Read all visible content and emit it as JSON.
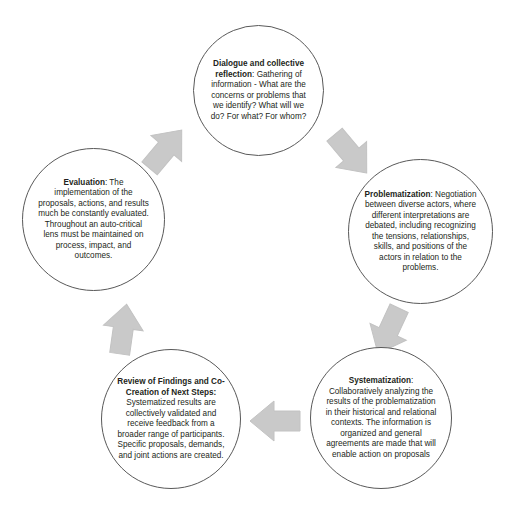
{
  "diagram": {
    "type": "cyclical-process",
    "direction": "clockwise",
    "palette": {
      "circle_stroke": "#595959",
      "arrow_fill": "#c9c9c9",
      "arrow_stroke": "#bfbfbf",
      "text": "#231f20",
      "background": "#ffffff"
    },
    "nodes": [
      {
        "id": "dialogue",
        "position": "top",
        "title": "Dialogue and collective reflection",
        "separator": ": ",
        "body": "Gathering of information - What are the concerns or problems that we identify? What will we do? For what? For whom?"
      },
      {
        "id": "problematization",
        "position": "right",
        "title": "Problematization",
        "separator": ": ",
        "body": "Negotiation between diverse actors, where different interpretations are debated, including recognizing the tensions, relationships, skills, and positions of the actors in relation to the problems."
      },
      {
        "id": "systematization",
        "position": "bottom-right",
        "title": "Systematization",
        "separator": ": ",
        "body": "Collaboratively analyzing the results of the problematization in their historical and relational contexts. The information is organized and general agreements are made that will enable action on proposals"
      },
      {
        "id": "review",
        "position": "bottom-left",
        "title": "Review of Findings and Co-Creation of Next Steps:",
        "separator": " ",
        "body": "Systematized results are collectively validated and receive feedback from a broader range of participants. Specific proposals, demands, and joint actions are created."
      },
      {
        "id": "evaluation",
        "position": "left",
        "title": "Evaluation",
        "separator": ": ",
        "body": "The implementation of the proposals, actions, and results much be constantly evaluated. Throughout an auto-critical lens must be maintained on process, impact, and outcomes."
      }
    ],
    "arrows": [
      {
        "id": "eval-to-dialogue",
        "from": "evaluation",
        "to": "dialogue",
        "points": "up-right"
      },
      {
        "id": "dialogue-to-problem",
        "from": "dialogue",
        "to": "problematization",
        "points": "down-right"
      },
      {
        "id": "problem-to-system",
        "from": "problematization",
        "to": "systematization",
        "points": "down-left"
      },
      {
        "id": "system-to-review",
        "from": "systematization",
        "to": "review",
        "points": "left"
      },
      {
        "id": "review-to-eval",
        "from": "review",
        "to": "evaluation",
        "points": "up"
      }
    ]
  }
}
